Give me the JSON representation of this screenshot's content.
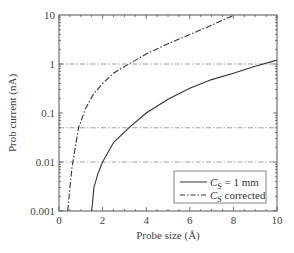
{
  "chart_data": {
    "type": "line",
    "title": "",
    "xlabel": "Probe size (Å)",
    "ylabel": "Prob current (nA)",
    "xlim": [
      0,
      10
    ],
    "ylim": [
      0.001,
      10
    ],
    "yscale": "log",
    "x_ticks": [
      "0",
      "2",
      "4",
      "6",
      "8",
      "10"
    ],
    "y_ticks": [
      "0.001",
      "0.01",
      "0.1",
      "1",
      "10"
    ],
    "grid": false,
    "reference_lines": [
      {
        "y": 1,
        "style": "dash-dot"
      },
      {
        "y": 0.05,
        "style": "dash-dot"
      },
      {
        "y": 0.01,
        "style": "dash-dot"
      }
    ],
    "legend_position": "lower right",
    "series": [
      {
        "name": "C_S = 1 mm",
        "style": "solid",
        "x": [
          1.5,
          1.6,
          1.8,
          2.0,
          2.5,
          3.2,
          4,
          5,
          6,
          7,
          8,
          9,
          10
        ],
        "y": [
          0.001,
          0.003,
          0.006,
          0.01,
          0.025,
          0.05,
          0.1,
          0.19,
          0.32,
          0.48,
          0.65,
          0.9,
          1.2
        ]
      },
      {
        "name": "C_S corrected",
        "style": "dash-dot",
        "x": [
          0.4,
          0.5,
          0.6,
          0.75,
          0.9,
          1.2,
          1.6,
          2.0,
          2.5,
          3.2,
          4,
          5,
          6,
          7,
          8
        ],
        "y": [
          0.001,
          0.003,
          0.008,
          0.02,
          0.05,
          0.12,
          0.25,
          0.4,
          0.65,
          1.0,
          1.6,
          2.6,
          4.0,
          6.2,
          9.8
        ]
      }
    ]
  },
  "legend": {
    "items": [
      {
        "symbol": "C",
        "subscript": "S",
        "suffix": " = 1 mm"
      },
      {
        "symbol": "C",
        "subscript": "S",
        "suffix": " corrected"
      }
    ]
  }
}
